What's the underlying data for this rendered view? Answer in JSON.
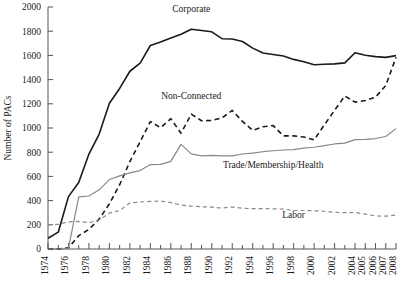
{
  "chart_data": {
    "type": "line",
    "title": "",
    "xlabel": "",
    "ylabel": "Number of PACs",
    "ylim": [
      0,
      2000
    ],
    "y_ticks": [
      0,
      200,
      400,
      600,
      800,
      1000,
      1200,
      1400,
      1600,
      1800,
      2000
    ],
    "grid": false,
    "legend_position": "inline-annotations",
    "x_tick_labels": [
      "1974",
      "1976",
      "1978",
      "1980",
      "1982",
      "1984",
      "1986",
      "1988",
      "1990",
      "1992",
      "1994",
      "1996",
      "1998",
      "2000",
      "2002",
      "2004",
      "2005",
      "2006",
      "2007",
      "2008"
    ],
    "x_minor_ticks_between_labels": true,
    "x_years": [
      1974,
      1975,
      1976,
      1977,
      1978,
      1979,
      1980,
      1981,
      1982,
      1983,
      1984,
      1985,
      1986,
      1987,
      1988,
      1989,
      1990,
      1991,
      1992,
      1993,
      1994,
      1995,
      1996,
      1997,
      1998,
      1999,
      2000,
      2001,
      2002,
      2003,
      2004,
      2005,
      2006,
      2007,
      2008
    ],
    "series": [
      {
        "name": "Corporate",
        "style": "solid",
        "color": "#1a1a1a",
        "label_x_year": 1988,
        "label_y_value": 1960,
        "values": [
          89,
          139,
          433,
          550,
          785,
          950,
          1204,
          1327,
          1469,
          1536,
          1682,
          1710,
          1744,
          1775,
          1816,
          1806,
          1795,
          1738,
          1735,
          1715,
          1660,
          1620,
          1608,
          1595,
          1567,
          1548,
          1523,
          1527,
          1530,
          1538,
          1622,
          1601,
          1590,
          1584,
          1598
        ]
      },
      {
        "name": "Non-Connected",
        "style": "dashed",
        "color": "#1a1a1a",
        "label_x_year": 1988,
        "label_y_value": 1240,
        "values": [
          0,
          0,
          10,
          110,
          162,
          247,
          374,
          531,
          723,
          886,
          1053,
          1003,
          1077,
          957,
          1115,
          1060,
          1062,
          1083,
          1145,
          1055,
          980,
          1010,
          1020,
          935,
          935,
          925,
          902,
          1026,
          1146,
          1264,
          1214,
          1227,
          1255,
          1350,
          1584
        ]
      },
      {
        "name": "Trade/Membership/Health",
        "style": "solid",
        "color": "#888888",
        "label_x_year": 1996,
        "label_y_value": 672,
        "values": [
          0,
          0,
          6,
          430,
          438,
          489,
          574,
          604,
          629,
          648,
          698,
          700,
          724,
          865,
          786,
          770,
          774,
          770,
          770,
          785,
          792,
          804,
          812,
          818,
          821,
          833,
          841,
          855,
          868,
          875,
          904,
          906,
          913,
          930,
          995
        ]
      },
      {
        "name": "Labor",
        "style": "dashed",
        "color": "#888888",
        "label_x_year": 1998,
        "label_y_value": 255,
        "values": [
          201,
          204,
          224,
          228,
          217,
          240,
          297,
          318,
          380,
          388,
          394,
          396,
          384,
          364,
          354,
          349,
          346,
          338,
          347,
          337,
          333,
          334,
          332,
          330,
          318,
          318,
          316,
          312,
          303,
          300,
          302,
          288,
          273,
          272,
          280
        ]
      }
    ]
  },
  "annotations": {
    "corporate": "Corporate",
    "non_connected": "Non-Connected",
    "trade": "Trade/Membership/Health",
    "labor": "Labor"
  },
  "axes": {
    "y_title": "Number of PACs"
  }
}
